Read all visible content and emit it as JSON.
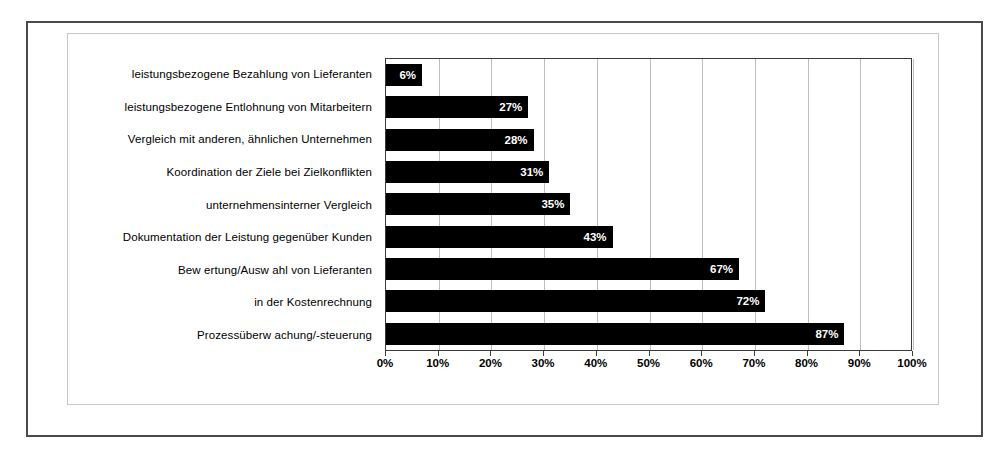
{
  "chart_data": {
    "type": "bar",
    "orientation": "horizontal",
    "title": "",
    "xlabel": "",
    "ylabel": "",
    "xlim": [
      0,
      100
    ],
    "grid": true,
    "legend": "none",
    "value_suffix": "%",
    "categories": [
      "leistungsbezogene Bezahlung von Lieferanten",
      "leistungsbezogene Entlohnung von Mitarbeitern",
      "Vergleich mit anderen, ähnlichen Unternehmen",
      "Koordination der Ziele bei Zielkonflikten",
      "unternehmensinterner Vergleich",
      "Dokumentation der Leistung gegenüber Kunden",
      "Bew ertung/Ausw ahl von Lieferanten",
      "in der Kostenrechnung",
      "Prozessüberw achung/-steuerung"
    ],
    "values": [
      6,
      27,
      28,
      31,
      35,
      43,
      67,
      72,
      87
    ],
    "data_labels": [
      "6%",
      "27%",
      "28%",
      "31%",
      "35%",
      "43%",
      "67%",
      "72%",
      "87%"
    ],
    "xticks": [
      0,
      10,
      20,
      30,
      40,
      50,
      60,
      70,
      80,
      90,
      100
    ],
    "xtick_labels": [
      "0%",
      "10%",
      "20%",
      "30%",
      "40%",
      "50%",
      "60%",
      "70%",
      "80%",
      "90%",
      "100%"
    ],
    "colors": {
      "bar": "#000000",
      "data_label": "#ffffff",
      "gridline": "#bdbdbd",
      "plot_border": "#3a3a3a",
      "outer_frame": "#4a4a4a",
      "inner_frame": "#c8c8c8",
      "background": "#ffffff",
      "text": "#000000"
    }
  }
}
